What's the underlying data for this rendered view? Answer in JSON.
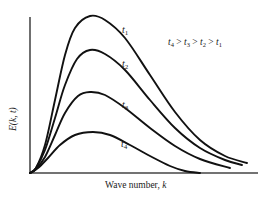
{
  "chart_data": {
    "type": "line",
    "title": "",
    "xlabel": "Wave number, k",
    "ylabel": "E(k, t)",
    "annotation": "t4 > t3 > t2 > t1",
    "grid": false,
    "legend_position": "inline labels near curves",
    "series": [
      {
        "name": "t1",
        "label_pos": [
          125,
          31
        ],
        "points": [
          [
            30,
            173
          ],
          [
            36,
            168
          ],
          [
            45,
            145
          ],
          [
            55,
            100
          ],
          [
            65,
            55
          ],
          [
            75,
            28
          ],
          [
            90,
            16
          ],
          [
            105,
            20
          ],
          [
            125,
            38
          ],
          [
            150,
            75
          ],
          [
            175,
            112
          ],
          [
            200,
            140
          ],
          [
            225,
            156
          ],
          [
            247,
            163
          ]
        ]
      },
      {
        "name": "t2",
        "label_pos": [
          125,
          65
        ],
        "points": [
          [
            30,
            173
          ],
          [
            36,
            168
          ],
          [
            45,
            150
          ],
          [
            55,
            118
          ],
          [
            65,
            85
          ],
          [
            77,
            59
          ],
          [
            90,
            50
          ],
          [
            105,
            54
          ],
          [
            125,
            70
          ],
          [
            150,
            100
          ],
          [
            175,
            128
          ],
          [
            200,
            148
          ],
          [
            225,
            160
          ],
          [
            242,
            165
          ]
        ]
      },
      {
        "name": "t3",
        "label_pos": [
          125,
          105
        ],
        "points": [
          [
            30,
            173
          ],
          [
            36,
            169
          ],
          [
            45,
            157
          ],
          [
            55,
            135
          ],
          [
            65,
            113
          ],
          [
            78,
            96
          ],
          [
            90,
            92
          ],
          [
            105,
            95
          ],
          [
            125,
            108
          ],
          [
            150,
            128
          ],
          [
            175,
            146
          ],
          [
            200,
            159
          ],
          [
            230,
            168
          ]
        ]
      },
      {
        "name": "t4",
        "label_pos": [
          125,
          145
        ],
        "points": [
          [
            30,
            173
          ],
          [
            38,
            168
          ],
          [
            48,
            158
          ],
          [
            60,
            145
          ],
          [
            75,
            135
          ],
          [
            93,
            132
          ],
          [
            110,
            135
          ],
          [
            130,
            145
          ],
          [
            150,
            156
          ],
          [
            170,
            166
          ],
          [
            185,
            171
          ],
          [
            200,
            173
          ]
        ]
      }
    ],
    "axes": {
      "origin": [
        30,
        173
      ],
      "x_end": 258,
      "y_top": 17
    },
    "ticks": {
      "x": [],
      "y": []
    }
  },
  "labels": {
    "xlabel": "Wave number, ",
    "xlabel_var": "k",
    "ylabel": "E(k, t)",
    "t1": "t",
    "t1_sub": "1",
    "t2": "t",
    "t2_sub": "2",
    "t3": "t",
    "t3_sub": "3",
    "t4": "t",
    "t4_sub": "4",
    "annotation_parts": [
      "t",
      "4",
      " > ",
      "t",
      "3",
      " > ",
      "t",
      "2",
      " > ",
      "t",
      "1"
    ]
  }
}
